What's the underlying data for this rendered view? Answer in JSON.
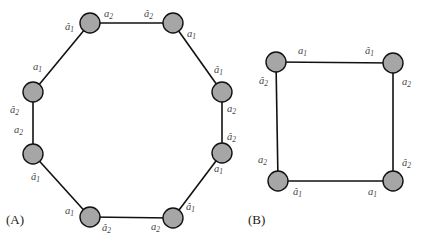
{
  "panels": [
    {
      "id": "A",
      "label": "(A)",
      "shape": "octagon"
    },
    {
      "id": "B",
      "label": "(B)",
      "shape": "square"
    }
  ],
  "colors": {
    "node_fill": "#a6a6a6",
    "edge": "#111111",
    "label": "#444444"
  },
  "octagon": {
    "nodes": [
      {
        "id": "n1",
        "x": 90,
        "y": 23
      },
      {
        "id": "n2",
        "x": 173,
        "y": 23
      },
      {
        "id": "n3",
        "x": 222,
        "y": 92
      },
      {
        "id": "n4",
        "x": 222,
        "y": 153
      },
      {
        "id": "n5",
        "x": 173,
        "y": 218
      },
      {
        "id": "n6",
        "x": 90,
        "y": 217
      },
      {
        "id": "n7",
        "x": 33,
        "y": 154
      },
      {
        "id": "n8",
        "x": 33,
        "y": 92
      }
    ],
    "labels": [
      {
        "text": "â",
        "sub": "1",
        "x": 65,
        "y": 30
      },
      {
        "text": "a",
        "sub": "2",
        "x": 104,
        "y": 17
      },
      {
        "text": "â",
        "sub": "2",
        "x": 144,
        "y": 17
      },
      {
        "text": "a",
        "sub": "1",
        "x": 187,
        "y": 37
      },
      {
        "text": "â",
        "sub": "1",
        "x": 214,
        "y": 73
      },
      {
        "text": "a",
        "sub": "2",
        "x": 227,
        "y": 112
      },
      {
        "text": "â",
        "sub": "2",
        "x": 227,
        "y": 140
      },
      {
        "text": "a",
        "sub": "1",
        "x": 214,
        "y": 172
      },
      {
        "text": "â",
        "sub": "1",
        "x": 186,
        "y": 210
      },
      {
        "text": "a",
        "sub": "2",
        "x": 151,
        "y": 230
      },
      {
        "text": "â",
        "sub": "2",
        "x": 102,
        "y": 231
      },
      {
        "text": "a",
        "sub": "1",
        "x": 65,
        "y": 214
      },
      {
        "text": "â",
        "sub": "1",
        "x": 31,
        "y": 180
      },
      {
        "text": "a",
        "sub": "2",
        "x": 14,
        "y": 133
      },
      {
        "text": "â",
        "sub": "2",
        "x": 10,
        "y": 113
      },
      {
        "text": "a",
        "sub": "1",
        "x": 33,
        "y": 70
      }
    ]
  },
  "square": {
    "nodes": [
      {
        "id": "s1",
        "x": 276,
        "y": 62
      },
      {
        "id": "s2",
        "x": 393,
        "y": 63
      },
      {
        "id": "s3",
        "x": 393,
        "y": 181
      },
      {
        "id": "s4",
        "x": 278,
        "y": 181
      }
    ],
    "labels": [
      {
        "text": "a",
        "sub": "1",
        "x": 298,
        "y": 54
      },
      {
        "text": "â",
        "sub": "1",
        "x": 365,
        "y": 54
      },
      {
        "text": "a",
        "sub": "2",
        "x": 402,
        "y": 85
      },
      {
        "text": "â",
        "sub": "2",
        "x": 259,
        "y": 84
      },
      {
        "text": "a",
        "sub": "2",
        "x": 258,
        "y": 163
      },
      {
        "text": "â",
        "sub": "2",
        "x": 402,
        "y": 166
      },
      {
        "text": "â",
        "sub": "1",
        "x": 293,
        "y": 195
      },
      {
        "text": "a",
        "sub": "1",
        "x": 368,
        "y": 195
      }
    ]
  }
}
